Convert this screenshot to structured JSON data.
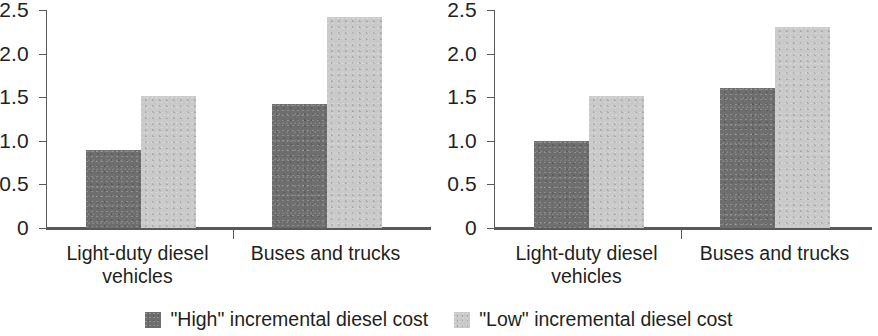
{
  "chart_data": [
    {
      "type": "bar",
      "title": "",
      "panel": "left",
      "xlabel": "",
      "ylabel": "",
      "categories": [
        "Light-duty diesel vehicles",
        "Buses and trucks"
      ],
      "category_lines": [
        [
          "Light-duty diesel",
          "vehicles"
        ],
        [
          "Buses and trucks"
        ]
      ],
      "series": [
        {
          "name": "\"High\" incremental diesel cost",
          "values": [
            0.9,
            1.42
          ],
          "color": "#6e6e6e"
        },
        {
          "name": "\"Low\" incremental diesel cost",
          "values": [
            1.51,
            2.42
          ],
          "color": "#c9c9c9"
        }
      ],
      "ylim": [
        0,
        2.5
      ],
      "yticks": [
        0,
        0.5,
        1.0,
        1.5,
        2.0,
        2.5
      ],
      "ytick_labels": [
        "0",
        "0.5",
        "1.0",
        "1.5",
        "2.0",
        "2.5"
      ],
      "grid": false,
      "legend_position": "bottom-center-shared"
    },
    {
      "type": "bar",
      "title": "",
      "panel": "right",
      "xlabel": "",
      "ylabel": "",
      "categories": [
        "Light-duty diesel vehicles",
        "Buses and trucks"
      ],
      "category_lines": [
        [
          "Light-duty diesel",
          "vehicles"
        ],
        [
          "Buses and trucks"
        ]
      ],
      "series": [
        {
          "name": "\"High\" incremental diesel cost",
          "values": [
            1.0,
            1.61
          ],
          "color": "#6e6e6e"
        },
        {
          "name": "\"Low\" incremental diesel cost",
          "values": [
            1.51,
            2.31
          ],
          "color": "#c9c9c9"
        }
      ],
      "ylim": [
        0,
        2.5
      ],
      "yticks": [
        0,
        0.5,
        1.0,
        1.5,
        2.0,
        2.5
      ],
      "ytick_labels": [
        "0",
        "0.5",
        "1.0",
        "1.5",
        "2.0",
        "2.5"
      ],
      "grid": false,
      "legend_position": "bottom-center-shared"
    }
  ],
  "legend": {
    "items": [
      {
        "label": "\"High\" incremental diesel cost",
        "color": "#6e6e6e"
      },
      {
        "label": "\"Low\" incremental diesel cost",
        "color": "#c9c9c9"
      }
    ]
  },
  "axis": {
    "ytick_labels": [
      "0",
      "0.5",
      "1.0",
      "1.5",
      "2.0",
      "2.5"
    ],
    "axis_color": "#58595b"
  }
}
